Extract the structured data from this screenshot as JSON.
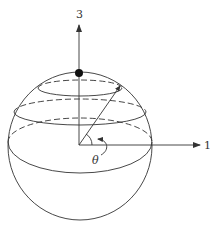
{
  "diagram": {
    "type": "sphere-coordinate-diagram",
    "axes": {
      "vertical_label": "3",
      "horizontal_label": "1"
    },
    "angle_label": "θ",
    "colors": {
      "stroke": "#333333",
      "background": "#ffffff",
      "pole_dot": "#111111"
    },
    "elements": [
      "sphere outline",
      "north pole dot",
      "latitude circle (top, dashed back)",
      "latitude circle (middle, dashed back)",
      "equator (dashed back)",
      "radius vector",
      "angle theta arc with curved arrow"
    ]
  }
}
